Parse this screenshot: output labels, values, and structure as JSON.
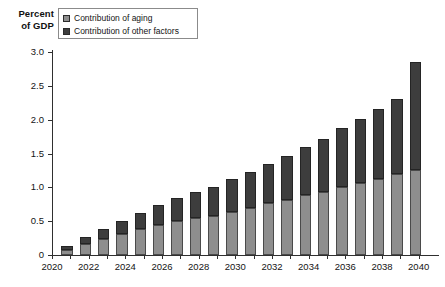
{
  "axis_title": {
    "line1": "Percent",
    "line2": "of GDP"
  },
  "legend": {
    "position": "top-left-inside",
    "items": [
      {
        "label": "Contribution of aging",
        "color": "#8e8e8e",
        "swatch_name": "legend-swatch-aging"
      },
      {
        "label": "Contribution of other factors",
        "color": "#3d3d3d",
        "swatch_name": "legend-swatch-other"
      }
    ]
  },
  "chart_data": {
    "type": "bar",
    "subtype": "stacked-vertical",
    "title": "",
    "subtitle": "",
    "xlabel": "",
    "ylabel": "Percent of GDP",
    "ylim": [
      0,
      3.0
    ],
    "xlim": [
      2020,
      2041
    ],
    "grid": false,
    "legend_position": "top-left-inside",
    "y_ticks": [
      "0",
      "0.5",
      "1.0",
      "1.5",
      "2.0",
      "2.5",
      "3.0"
    ],
    "y_tick_values": [
      0,
      0.5,
      1.0,
      1.5,
      2.0,
      2.5,
      3.0
    ],
    "x_tick_labels": [
      "2020",
      "2022",
      "2024",
      "2026",
      "2028",
      "2030",
      "2032",
      "2034",
      "2036",
      "2038",
      "2040"
    ],
    "x_tick_values": [
      2020,
      2022,
      2024,
      2026,
      2028,
      2030,
      2032,
      2034,
      2036,
      2038,
      2040
    ],
    "categories": [
      2021,
      2022,
      2023,
      2024,
      2025,
      2026,
      2027,
      2028,
      2029,
      2030,
      2031,
      2032,
      2033,
      2034,
      2035,
      2036,
      2037,
      2038,
      2039,
      2040
    ],
    "series": [
      {
        "name": "Contribution of aging",
        "color": "#8e8e8e",
        "values": [
          0.08,
          0.16,
          0.24,
          0.31,
          0.38,
          0.44,
          0.5,
          0.54,
          0.58,
          0.63,
          0.7,
          0.77,
          0.82,
          0.88,
          0.93,
          1.0,
          1.06,
          1.12,
          1.19,
          1.25
        ]
      },
      {
        "name": "Contribution of other factors",
        "color": "#3d3d3d",
        "values": [
          0.05,
          0.1,
          0.14,
          0.19,
          0.24,
          0.3,
          0.34,
          0.39,
          0.43,
          0.49,
          0.53,
          0.58,
          0.65,
          0.72,
          0.79,
          0.87,
          0.95,
          1.04,
          1.12,
          1.6
        ]
      }
    ],
    "totals": [
      0.13,
      0.26,
      0.38,
      0.5,
      0.62,
      0.74,
      0.84,
      0.93,
      1.01,
      1.12,
      1.23,
      1.35,
      1.47,
      1.6,
      1.72,
      1.87,
      2.01,
      2.16,
      2.31,
      2.85
    ]
  }
}
